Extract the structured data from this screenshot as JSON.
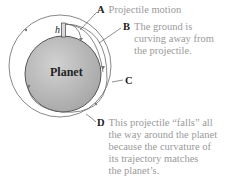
{
  "diagram": {
    "planet_label": "Planet",
    "height_label": "h",
    "colors": {
      "planet_fill": "#b4b4b4",
      "planet_stroke": "#555555",
      "trajectory": "#6a6a6a",
      "text": "#9a9a9a",
      "key": "#222222"
    },
    "labels": [
      {
        "key": "A",
        "lines": [
          "Projectile motion"
        ]
      },
      {
        "key": "B",
        "lines": [
          "The ground is",
          "curving away from",
          "the projectile."
        ]
      },
      {
        "key": "C",
        "lines": []
      },
      {
        "key": "D",
        "lines": [
          "This projectile “falls” all",
          "the way around the planet",
          "because the curvature of",
          "its trajectory matches",
          "the planet’s."
        ]
      }
    ]
  }
}
